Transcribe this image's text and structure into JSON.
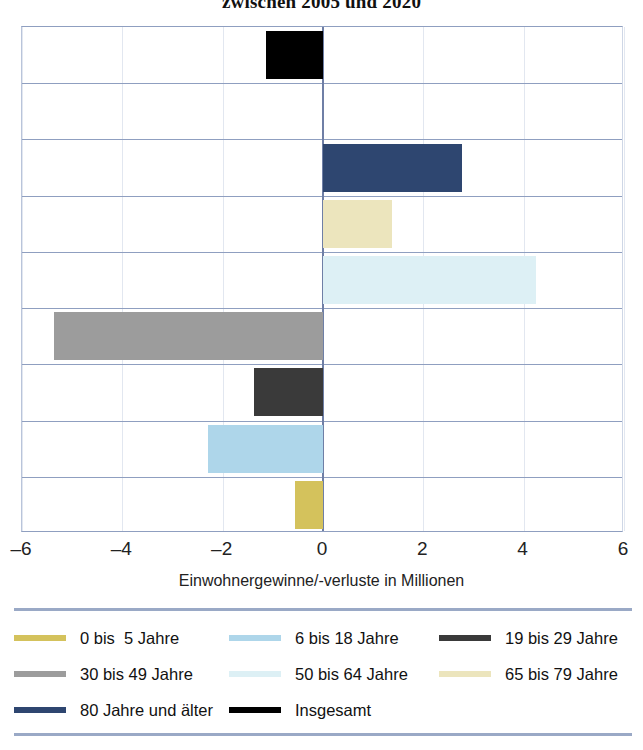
{
  "chart_data": {
    "type": "bar",
    "orientation": "horizontal",
    "title": "zwischen 2005 und 2020",
    "xlabel": "Einwohnergewinne/-verluste in Millionen",
    "ylabel": "",
    "xlim": [
      -6,
      6
    ],
    "xticks": [
      "–6",
      "–4",
      "–2",
      "0",
      "2",
      "4",
      "6"
    ],
    "xtick_values": [
      -6,
      -4,
      -2,
      0,
      2,
      4,
      6
    ],
    "grid": true,
    "legend_position": "bottom",
    "categories": [
      "Insgesamt",
      "80 Jahre und älter",
      "65 bis 79 Jahre",
      "50 bis 64 Jahre",
      "30 bis 49 Jahre",
      "19 bis 29 Jahre",
      "6 bis 18 Jahre",
      "0 bis  5 Jahre"
    ],
    "values": [
      -1.13,
      2.77,
      1.37,
      4.24,
      -5.36,
      -1.37,
      -2.29,
      -0.56
    ],
    "colors": [
      "#000000",
      "#2e4670",
      "#ece5bd",
      "#ddf0f5",
      "#9c9c9c",
      "#3a3a3a",
      "#aed6ea",
      "#d4c25c"
    ],
    "bars": [
      {
        "name": "Insgesamt",
        "value": -1.13,
        "color": "#000000",
        "row": 0
      },
      {
        "name": "80 Jahre und älter",
        "value": 2.77,
        "color": "#2e4670",
        "row": 2
      },
      {
        "name": "65 bis 79 Jahre",
        "value": 1.37,
        "color": "#ece5bd",
        "row": 3
      },
      {
        "name": "50 bis 64 Jahre",
        "value": 4.24,
        "color": "#ddf0f5",
        "row": 4
      },
      {
        "name": "30 bis 49 Jahre",
        "value": -5.36,
        "color": "#9c9c9c",
        "row": 5
      },
      {
        "name": "19 bis 29 Jahre",
        "value": -1.37,
        "color": "#3a3a3a",
        "row": 6
      },
      {
        "name": "6 bis 18 Jahre",
        "value": -2.29,
        "color": "#aed6ea",
        "row": 7
      },
      {
        "name": "0 bis  5 Jahre",
        "value": -0.56,
        "color": "#d4c25c",
        "row": 8
      }
    ]
  },
  "legend": {
    "rows": [
      [
        {
          "label": "0 bis  5 Jahre",
          "color": "#d4c25c"
        },
        {
          "label": "6 bis 18 Jahre",
          "color": "#aed6ea"
        },
        {
          "label": "19 bis 29 Jahre",
          "color": "#3a3a3a"
        }
      ],
      [
        {
          "label": "30 bis 49 Jahre",
          "color": "#9c9c9c"
        },
        {
          "label": "50 bis 64 Jahre",
          "color": "#ddf0f5"
        },
        {
          "label": "65 bis 79 Jahre",
          "color": "#ece5bd"
        }
      ],
      [
        {
          "label": "80 Jahre und älter",
          "color": "#2e4670"
        },
        {
          "label": "Insgesamt",
          "color": "#000000"
        }
      ]
    ]
  },
  "colors": {
    "grid_major": "#8f9fc0",
    "grid_minor": "#e2e7f0",
    "zero_line": "#6f7fa6",
    "legend_rule": "#9aa9c6",
    "background": "#ffffff",
    "text": "#1a1a1a"
  }
}
